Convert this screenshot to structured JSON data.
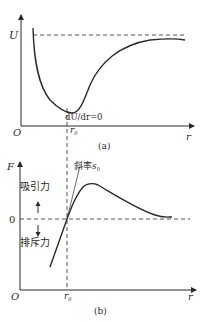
{
  "figure_a": {
    "y_axis_label": "U",
    "origin_label": "O",
    "x_axis_label": "r",
    "r0_label": "r",
    "r0_subscript": "0",
    "min_annotation": "dU/dr=0",
    "caption": "(a)"
  },
  "figure_b": {
    "y_axis_label": "F",
    "origin_label": "O",
    "x_axis_label": "r",
    "r0_label": "r",
    "r0_subscript": "0",
    "zero_label": "0",
    "slope_label": "斜率",
    "slope_symbol": "s",
    "slope_subscript": "0",
    "attraction_label": "吸引力",
    "repulsion_label": "排斥力",
    "caption": "(b)"
  },
  "colors": {
    "line": "#2a2a2a",
    "background": "#ffffff"
  }
}
